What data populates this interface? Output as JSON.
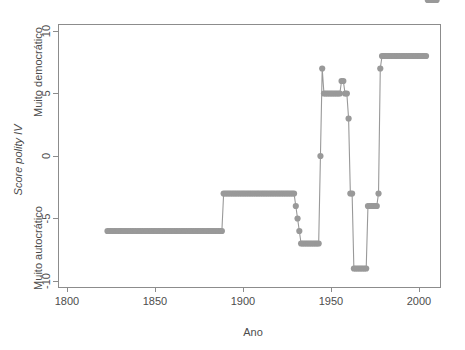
{
  "chart_data": {
    "type": "line",
    "title": "",
    "xlabel": "Ano",
    "ylabel": "Score polity IV",
    "ylabel_top": "Muito democrático",
    "ylabel_bottom": "Muito autocrático",
    "xlim": [
      1795,
      2012
    ],
    "ylim": [
      -10.5,
      10.5
    ],
    "xticks": [
      1800,
      1850,
      1900,
      1950,
      2000
    ],
    "xtick_labels": [
      "1800",
      "1850",
      "1900",
      "1950",
      "2000"
    ],
    "yticks": [
      -10,
      -5,
      0,
      5,
      10
    ],
    "ytick_labels": [
      "-10",
      "-5",
      "0",
      "5",
      "10"
    ],
    "grid": false,
    "legend": "none",
    "line_color": "#999999",
    "point_color": "#999999",
    "axis_color": "#8c8c8c",
    "x": [
      1823,
      1824,
      1825,
      1826,
      1827,
      1828,
      1829,
      1830,
      1831,
      1832,
      1833,
      1834,
      1835,
      1836,
      1837,
      1838,
      1839,
      1840,
      1841,
      1842,
      1843,
      1844,
      1845,
      1846,
      1847,
      1848,
      1849,
      1850,
      1851,
      1852,
      1853,
      1854,
      1855,
      1856,
      1857,
      1858,
      1859,
      1860,
      1861,
      1862,
      1863,
      1864,
      1865,
      1866,
      1867,
      1868,
      1869,
      1870,
      1871,
      1872,
      1873,
      1874,
      1875,
      1876,
      1877,
      1878,
      1879,
      1880,
      1881,
      1882,
      1883,
      1884,
      1885,
      1886,
      1887,
      1888,
      1889,
      1890,
      1891,
      1892,
      1893,
      1894,
      1895,
      1896,
      1897,
      1898,
      1899,
      1900,
      1901,
      1902,
      1903,
      1904,
      1905,
      1906,
      1907,
      1908,
      1909,
      1910,
      1911,
      1912,
      1913,
      1914,
      1915,
      1916,
      1917,
      1918,
      1919,
      1920,
      1921,
      1922,
      1923,
      1924,
      1925,
      1926,
      1927,
      1928,
      1929,
      1930,
      1931,
      1932,
      1933,
      1934,
      1935,
      1936,
      1937,
      1938,
      1939,
      1940,
      1941,
      1942,
      1943,
      1944,
      1945,
      1946,
      1947,
      1948,
      1949,
      1950,
      1951,
      1952,
      1953,
      1954,
      1955,
      1956,
      1957,
      1958,
      1959,
      1960,
      1961,
      1962,
      1963,
      1964,
      1965,
      1966,
      1967,
      1968,
      1969,
      1970,
      1971,
      1972,
      1973,
      1974,
      1975,
      1976,
      1977,
      1978,
      1979,
      1980,
      1981,
      1982,
      1983,
      1984,
      1985,
      1986,
      1987,
      1988,
      1989,
      1990,
      1991,
      1992,
      1993,
      1994,
      1995,
      1996,
      1997,
      1998,
      1999,
      2000,
      2001,
      2002,
      2003,
      2004,
      2005,
      2006,
      2007,
      2008,
      2009,
      2010
    ],
    "y": [
      -6,
      -6,
      -6,
      -6,
      -6,
      -6,
      -6,
      -6,
      -6,
      -6,
      -6,
      -6,
      -6,
      -6,
      -6,
      -6,
      -6,
      -6,
      -6,
      -6,
      -6,
      -6,
      -6,
      -6,
      -6,
      -6,
      -6,
      -6,
      -6,
      -6,
      -6,
      -6,
      -6,
      -6,
      -6,
      -6,
      -6,
      -6,
      -6,
      -6,
      -6,
      -6,
      -6,
      -6,
      -6,
      -6,
      -6,
      -6,
      -6,
      -6,
      -6,
      -6,
      -6,
      -6,
      -6,
      -6,
      -6,
      -6,
      -6,
      -6,
      -6,
      -6,
      -6,
      -6,
      -6,
      -6,
      -3,
      -3,
      -3,
      -3,
      -3,
      -3,
      -3,
      -3,
      -3,
      -3,
      -3,
      -3,
      -3,
      -3,
      -3,
      -3,
      -3,
      -3,
      -3,
      -3,
      -3,
      -3,
      -3,
      -3,
      -3,
      -3,
      -3,
      -3,
      -3,
      -3,
      -3,
      -3,
      -3,
      -3,
      -3,
      -3,
      -3,
      -3,
      -3,
      -3,
      -3,
      -4,
      -5,
      -6,
      -7,
      -7,
      -7,
      -7,
      -7,
      -7,
      -7,
      -7,
      -7,
      -7,
      -7,
      0,
      7,
      5,
      5,
      5,
      5,
      5,
      5,
      5,
      5,
      5,
      5,
      6,
      6,
      5,
      5,
      3,
      -3,
      -3,
      -9,
      -9,
      -9,
      -9,
      -9,
      -9,
      -9,
      -9,
      -4,
      -4,
      -4,
      -4,
      -4,
      -4,
      -3,
      7,
      8,
      8,
      8,
      8,
      8,
      8,
      8,
      8,
      8,
      8,
      8,
      8,
      8,
      8,
      8,
      8,
      8,
      8,
      8,
      8,
      8,
      8,
      8,
      8,
      8,
      8
    ]
  }
}
